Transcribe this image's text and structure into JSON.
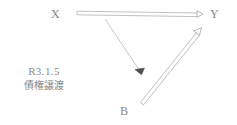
{
  "diagram": {
    "type": "legal-relationship-diagram",
    "colors": {
      "hollow_line": "#b9b9b9",
      "thin_line": "#bdbdbd",
      "solid_arrow": "#5a5a5a",
      "text": "#878787"
    },
    "nodes": [
      {
        "id": "x",
        "label": "X",
        "x": 51,
        "y": 7
      },
      {
        "id": "y",
        "label": "Y",
        "x": 210,
        "y": 7
      },
      {
        "id": "b",
        "label": "B",
        "x": 120,
        "y": 104
      }
    ],
    "edges": [
      {
        "id": "x-to-y",
        "from": "X",
        "to": "Y",
        "style": "hollow-double-line",
        "arrowhead": "open-right",
        "x1": 77,
        "y1": 13,
        "x2": 200,
        "y2": 15
      },
      {
        "id": "x-to-b",
        "from": "X",
        "to": "B",
        "style": "thin-single-line",
        "arrowhead": "solid-filled",
        "x1": 105,
        "y1": 19,
        "x2": 143,
        "y2": 75
      },
      {
        "id": "b-to-y",
        "from": "B",
        "to": "Y",
        "style": "hollow-double-line",
        "arrowhead": "open-up-right",
        "x1": 142,
        "y1": 102,
        "x2": 201,
        "y2": 29
      }
    ]
  },
  "annotation": {
    "date": "R3.1.5",
    "term": "債権譲渡"
  }
}
